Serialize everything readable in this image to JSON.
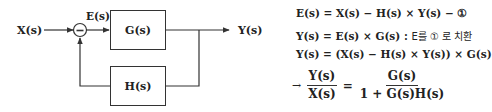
{
  "diagram": {
    "input_label": "X(s)",
    "error_label": "E(s)",
    "summing_sign": "−",
    "forward_block": "G(s)",
    "feedback_block": "H(s)",
    "output_label": "Y(s)",
    "line_color": "#333333"
  },
  "equations": {
    "eq1": "E(s) = X(s) − H(s) × Y(s) − ①",
    "eq2_math": "Y(s) = E(s) × G(s) : ",
    "eq2_korean": "E를 ① 로 치환",
    "eq3": "Y(s) = (X(s) − H(s) × Y(s)) × G(s)",
    "final": {
      "arrow": "→",
      "lhs_num": "Y(s)",
      "lhs_den": "X(s)",
      "equals": "=",
      "rhs_num": "G(s)",
      "rhs_den": "1 + G(s)H(s)"
    }
  }
}
